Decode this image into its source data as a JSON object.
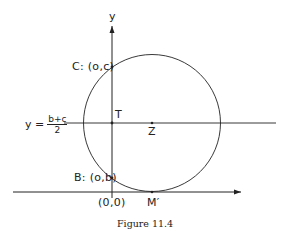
{
  "figure": {
    "caption": "Figure 11.4",
    "axes": {
      "y_label": "y",
      "origin_label": "(0,0)"
    },
    "points": {
      "C": "C: (o,c)",
      "B": "B: (o,b)",
      "T": "T",
      "Z": "Z",
      "M_prime": "M′"
    },
    "midline": {
      "lhs": "y =",
      "numerator": "b+c",
      "denominator": "2"
    },
    "colors": {
      "stroke": "#222222",
      "background": "#ffffff"
    }
  }
}
